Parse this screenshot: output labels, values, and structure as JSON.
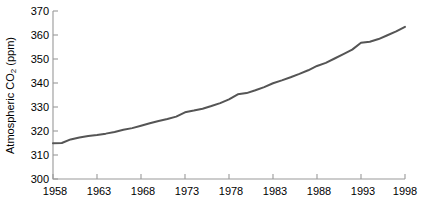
{
  "chart_data": {
    "type": "line",
    "title": "",
    "xlabel": "",
    "ylabel": "Atmospheric CO2 (ppm)",
    "ylabel_prefix": "Atmospheric CO",
    "ylabel_sub": "2",
    "ylabel_suffix": " (ppm)",
    "xlim": [
      1958,
      1998
    ],
    "ylim": [
      300,
      370
    ],
    "xticks": [
      1958,
      1963,
      1968,
      1973,
      1978,
      1983,
      1988,
      1993,
      1998
    ],
    "xtick_labels": [
      "1958",
      "1963",
      "1968",
      "1973",
      "1978",
      "1983",
      "1988",
      "1993",
      "1998"
    ],
    "yticks": [
      300,
      310,
      320,
      330,
      340,
      350,
      360,
      370
    ],
    "ytick_labels": [
      "300",
      "310",
      "320",
      "330",
      "340",
      "350",
      "360",
      "370"
    ],
    "grid": false,
    "legend": null,
    "line_color": "#555555",
    "line_width": 2.0,
    "axis_color": "#999999",
    "background": "#ffffff",
    "x": [
      1958,
      1959,
      1960,
      1961,
      1962,
      1963,
      1964,
      1965,
      1966,
      1967,
      1968,
      1969,
      1970,
      1971,
      1972,
      1973,
      1974,
      1975,
      1976,
      1977,
      1978,
      1979,
      1980,
      1981,
      1982,
      1983,
      1984,
      1985,
      1986,
      1987,
      1988,
      1989,
      1990,
      1991,
      1992,
      1993,
      1994,
      1995,
      1996,
      1997,
      1998
    ],
    "values": [
      314.9,
      315.0,
      316.5,
      317.3,
      317.9,
      318.3,
      318.9,
      319.6,
      320.5,
      321.2,
      322.2,
      323.2,
      324.2,
      325.0,
      326.0,
      327.8,
      328.5,
      329.3,
      330.4,
      331.6,
      333.2,
      335.3,
      335.8,
      337.0,
      338.3,
      339.9,
      341.1,
      342.4,
      343.8,
      345.3,
      347.1,
      348.4,
      350.2,
      352.0,
      353.9,
      356.8,
      357.2,
      358.3,
      359.9,
      361.5,
      363.4
    ],
    "series": [
      {
        "name": "Mauna Loa annual mean CO2",
        "values": [
          314.9,
          315.0,
          316.5,
          317.3,
          317.9,
          318.3,
          318.9,
          319.6,
          320.5,
          321.2,
          322.2,
          323.2,
          324.2,
          325.0,
          326.0,
          327.8,
          328.5,
          329.3,
          330.4,
          331.6,
          333.2,
          335.3,
          335.8,
          337.0,
          338.3,
          339.9,
          341.1,
          342.4,
          343.8,
          345.3,
          347.1,
          348.4,
          350.2,
          352.0,
          353.9,
          356.8,
          357.2,
          358.3,
          359.9,
          361.5,
          363.4
        ]
      }
    ]
  }
}
